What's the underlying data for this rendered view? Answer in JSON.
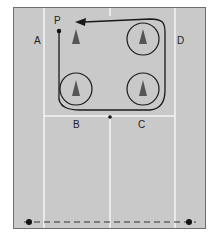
{
  "diagram": {
    "title": "",
    "labels": {
      "A": "A",
      "B": "B",
      "C": "C",
      "D": "D",
      "P": "P"
    },
    "cones": 4,
    "colors": {
      "court": "#c9c9c9",
      "lines": "#f4f4f4",
      "path": "#1a1a1a",
      "cone": "#555555"
    }
  }
}
